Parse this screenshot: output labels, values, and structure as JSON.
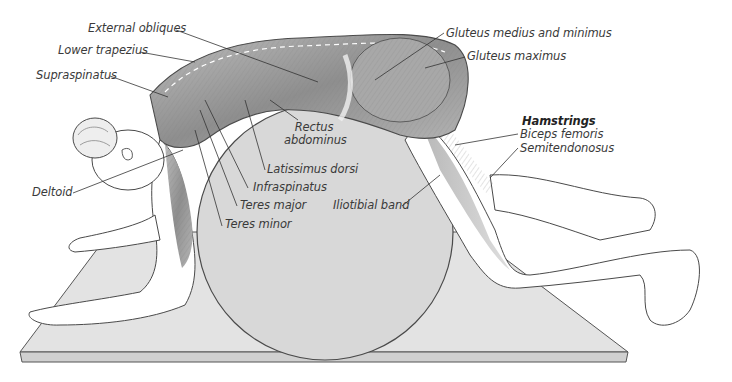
{
  "figure": {
    "colors": {
      "background": "#ffffff",
      "mat": "#e2e2e2",
      "ball": "#d9d9d9",
      "muscle": "#9a9a9a",
      "outline": "#4a4a4a",
      "label_text": "#3a3a3a"
    }
  },
  "labels": {
    "external_obliques": "External obliques",
    "lower_trapezius": "Lower trapezius",
    "supraspinatus": "Supraspinatus",
    "deltoid": "Deltoid",
    "rectus_abdominus_line1": "Rectus",
    "rectus_abdominus_line2": "abdominus",
    "latissimus_dorsi": "Latissimus dorsi",
    "infraspinatus": "Infraspinatus",
    "teres_major": "Teres major",
    "teres_minor": "Teres minor",
    "iliotibial_band": "Iliotibial band",
    "gluteus_medius_minimus": "Gluteus medius and minimus",
    "gluteus_maximus": "Gluteus maximus",
    "hamstrings_heading": "Hamstrings",
    "biceps_femoris": "Biceps femoris",
    "semitendonosus": "Semitendonosus"
  }
}
